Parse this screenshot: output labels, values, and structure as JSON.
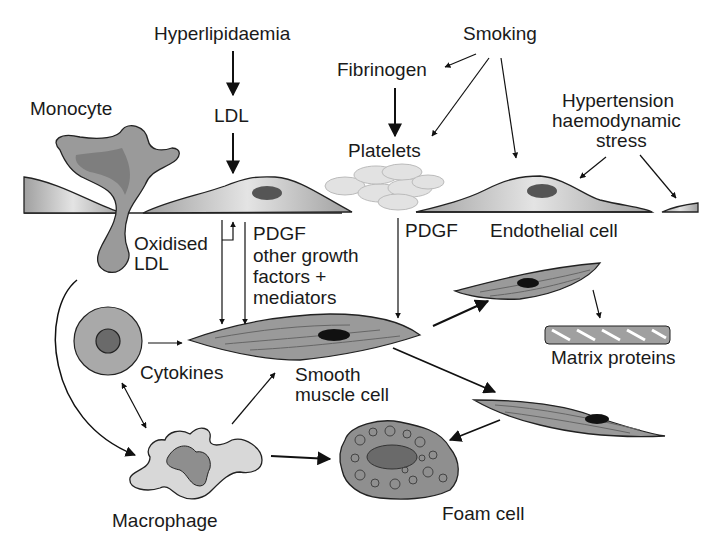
{
  "diagram": {
    "labels": {
      "hyperlipidaemia": "Hyperlipidaemia",
      "ldl": "LDL",
      "smoking": "Smoking",
      "fibrinogen": "Fibrinogen",
      "platelets": "Platelets",
      "hypertension_1": "Hypertension",
      "hypertension_2": "haemodynamic",
      "hypertension_3": "stress",
      "monocyte": "Monocyte",
      "oxidised_1": "Oxidised",
      "oxidised_2": "LDL",
      "pdgf_left_1": "PDGF",
      "pdgf_left_2": "other growth",
      "pdgf_left_3": "factors +",
      "pdgf_left_4": "mediators",
      "pdgf_right": "PDGF",
      "endothelial": "Endothelial cell",
      "cytokines": "Cytokines",
      "smooth_1": "Smooth",
      "smooth_2": "muscle cell",
      "matrix": "Matrix proteins",
      "macrophage": "Macrophage",
      "foam": "Foam cell"
    },
    "nodes": [
      "Hyperlipidaemia",
      "LDL",
      "Smoking",
      "Fibrinogen",
      "Platelets",
      "Hypertension haemodynamic stress",
      "Monocyte",
      "Endothelial cell",
      "Oxidised LDL",
      "Cytokines",
      "Smooth muscle cell",
      "Matrix proteins",
      "Macrophage",
      "Foam cell"
    ],
    "edges": [
      {
        "from": "Hyperlipidaemia",
        "to": "LDL"
      },
      {
        "from": "LDL",
        "to": "Endothelial cell"
      },
      {
        "from": "Smoking",
        "to": "Fibrinogen"
      },
      {
        "from": "Smoking",
        "to": "Platelets"
      },
      {
        "from": "Smoking",
        "to": "Endothelial cell"
      },
      {
        "from": "Fibrinogen",
        "to": "Platelets"
      },
      {
        "from": "Hypertension haemodynamic stress",
        "to": "Endothelial cell"
      },
      {
        "from": "Endothelial cell",
        "to": "Smooth muscle cell",
        "label": "Oxidised LDL"
      },
      {
        "from": "Endothelial cell",
        "to": "Smooth muscle cell",
        "label": "PDGF other growth factors + mediators"
      },
      {
        "from": "Platelets",
        "to": "Smooth muscle cell",
        "label": "PDGF"
      },
      {
        "from": "Monocyte",
        "to": "Macrophage"
      },
      {
        "from": "Cytokines",
        "to": "Smooth muscle cell"
      },
      {
        "from": "Cytokines",
        "to": "Macrophage",
        "bidirectional": true
      },
      {
        "from": "Macrophage",
        "to": "Smooth muscle cell"
      },
      {
        "from": "Macrophage",
        "to": "Foam cell"
      },
      {
        "from": "Smooth muscle cell",
        "to": "Smooth muscle cell (proliferating)"
      },
      {
        "from": "Smooth muscle cell (proliferating)",
        "to": "Matrix proteins"
      },
      {
        "from": "Smooth muscle cell (migrating)",
        "to": "Foam cell"
      }
    ]
  }
}
